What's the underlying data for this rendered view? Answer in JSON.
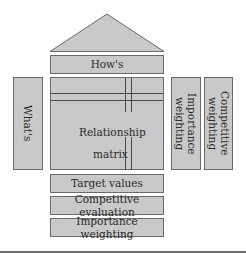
{
  "diagram": {
    "roof": {
      "label": ""
    },
    "hows": {
      "label": "How's"
    },
    "whats": {
      "label": "What's"
    },
    "matrix": {
      "label_line1": "Relationship",
      "label_line2": "matrix"
    },
    "importance_weighting_side": {
      "label": "Importance\nweighting"
    },
    "competitive_weighting_side": {
      "label": "Competitive\nweighting"
    },
    "target_values": {
      "label": "Target values"
    },
    "competitive_evaluation": {
      "label": "Competitive evaluation"
    },
    "importance_weighting_bottom": {
      "label": "Importance weighting"
    }
  },
  "colors": {
    "fill": "#c9c9c9",
    "border": "#6a6a6a",
    "text": "#2a2a2a"
  }
}
